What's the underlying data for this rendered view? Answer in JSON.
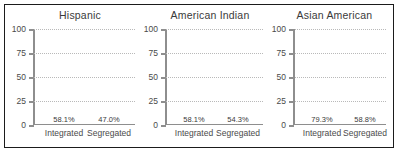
{
  "chart_data": {
    "type": "bar",
    "title": "",
    "xlabel": "",
    "ylabel": "",
    "ylim": [
      0,
      100
    ],
    "yticks": [
      0,
      25,
      50,
      75,
      100
    ],
    "ytick_labels": [
      "0",
      "25",
      "50",
      "75",
      "100"
    ],
    "grid": true,
    "legend": "none",
    "categories": [
      "Integrated",
      "Segregated"
    ],
    "value_suffix": "%",
    "colors": {
      "integrated": "#1a1a1a",
      "segregated": "#adadad",
      "axis": "#8e8e8e",
      "gridline": "#b9b9b9",
      "border": "#1b1b1b",
      "text": "#3a3a3a",
      "background": "#ffffff"
    },
    "panels": [
      {
        "title": "Hispanic",
        "categories": [
          "Integrated",
          "Segregated"
        ],
        "values": [
          58.1,
          47.0
        ],
        "value_labels": [
          "58.1%",
          "47.0%"
        ]
      },
      {
        "title": "American Indian",
        "categories": [
          "Integrated",
          "Segregated"
        ],
        "values": [
          58.1,
          54.3
        ],
        "value_labels": [
          "58.1%",
          "54.3%"
        ]
      },
      {
        "title": "Asian American",
        "categories": [
          "Integrated",
          "Segregated"
        ],
        "values": [
          79.3,
          58.8
        ],
        "value_labels": [
          "79.3%",
          "58.8%"
        ]
      }
    ]
  }
}
